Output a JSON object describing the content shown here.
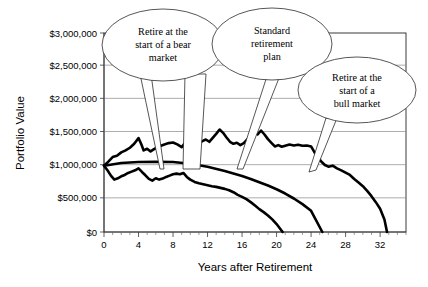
{
  "chart_data": {
    "type": "line",
    "title": "",
    "xlabel": "Years after Retirement",
    "ylabel": "Portfolio Value",
    "xlim": [
      0,
      35
    ],
    "ylim": [
      0,
      3000000
    ],
    "grid": true,
    "legend_position": "none",
    "y_ticks": [
      0,
      500000,
      1000000,
      1500000,
      2000000,
      2500000,
      3000000
    ],
    "y_tick_labels": [
      "$0",
      "$500,000",
      "$1,000,000",
      "$1,500,000",
      "$2,000,000",
      "$2,500,000",
      "$3,000,000"
    ],
    "x_ticks": [
      0,
      4,
      8,
      12,
      16,
      20,
      24,
      28,
      32
    ],
    "x_tick_labels": [
      "0",
      "4",
      "8",
      "12",
      "16",
      "20",
      "24",
      "28",
      "32"
    ],
    "x_minor_tick_step": 1,
    "series": [
      {
        "name": "Retire at the start of a bull market",
        "x": [
          0,
          0.5,
          1,
          1.5,
          2,
          2.5,
          3,
          3.5,
          4,
          4.3,
          4.6,
          5,
          5.4,
          5.8,
          6.2,
          6.6,
          7,
          7.5,
          8,
          8.5,
          9,
          9.4,
          9.8,
          10.2,
          10.6,
          11,
          11.4,
          11.8,
          12.2,
          12.6,
          13,
          13.4,
          13.8,
          14.2,
          14.6,
          15,
          15.4,
          15.8,
          16.2,
          16.6,
          17,
          17.4,
          17.8,
          18.2,
          18.6,
          19,
          19.4,
          19.8,
          20.2,
          20.6,
          21,
          21.5,
          22,
          22.5,
          23,
          23.5,
          24,
          24.4,
          24.8,
          25.2,
          25.6,
          26,
          26.5,
          27,
          27.5,
          28,
          28.5,
          29,
          29.5,
          30,
          30.5,
          31,
          31.5,
          32,
          32.5,
          32.8
        ],
        "y": [
          1000000,
          1060000,
          1130000,
          1150000,
          1200000,
          1230000,
          1270000,
          1330000,
          1415000,
          1330000,
          1230000,
          1255000,
          1215000,
          1250000,
          1280000,
          1300000,
          1320000,
          1340000,
          1350000,
          1320000,
          1280000,
          1345000,
          1470000,
          1440000,
          1390000,
          1340000,
          1370000,
          1395000,
          1360000,
          1420000,
          1480000,
          1545000,
          1495000,
          1425000,
          1360000,
          1330000,
          1345000,
          1310000,
          1340000,
          1395000,
          1460000,
          1505000,
          1470000,
          1530000,
          1470000,
          1400000,
          1345000,
          1290000,
          1310000,
          1285000,
          1300000,
          1320000,
          1305000,
          1315000,
          1300000,
          1305000,
          1290000,
          1200000,
          1130000,
          1060000,
          1010000,
          985000,
          1000000,
          960000,
          930000,
          895000,
          860000,
          800000,
          745000,
          690000,
          620000,
          540000,
          450000,
          350000,
          190000,
          0
        ],
        "style": "volatile-upper",
        "callout": "Retire at the start of a bull market"
      },
      {
        "name": "Standard retirement plan",
        "x": [
          0,
          2,
          4,
          6,
          8,
          10,
          12,
          14,
          16,
          17,
          18,
          19,
          20,
          21,
          22,
          23,
          24,
          25.3
        ],
        "y": [
          1000000,
          1040000,
          1055000,
          1060000,
          1055000,
          1030000,
          985000,
          920000,
          845000,
          800000,
          750000,
          700000,
          645000,
          580000,
          505000,
          420000,
          320000,
          0
        ],
        "style": "smooth-middle",
        "callout": "Standard retirement plan"
      },
      {
        "name": "Retire at the start of a bear market",
        "x": [
          0,
          0.4,
          0.8,
          1.2,
          1.6,
          2,
          2.4,
          2.8,
          3.2,
          3.6,
          4,
          4.4,
          4.8,
          5.2,
          5.6,
          6,
          6.4,
          6.8,
          7.2,
          7.6,
          8,
          8.4,
          8.8,
          9.2,
          9.6,
          10,
          10.5,
          11,
          11.5,
          12,
          12.5,
          13,
          13.5,
          14,
          14.5,
          15,
          15.5,
          16,
          16.5,
          17,
          17.5,
          18,
          18.5,
          19,
          19.5,
          20,
          20.7
        ],
        "y": [
          1000000,
          930000,
          850000,
          790000,
          810000,
          840000,
          860000,
          890000,
          910000,
          930000,
          960000,
          905000,
          855000,
          800000,
          775000,
          810000,
          790000,
          805000,
          830000,
          850000,
          870000,
          880000,
          870000,
          890000,
          830000,
          790000,
          755000,
          735000,
          720000,
          705000,
          690000,
          680000,
          665000,
          650000,
          630000,
          600000,
          560000,
          530000,
          495000,
          450000,
          400000,
          345000,
          300000,
          250000,
          190000,
          120000,
          0
        ],
        "style": "volatile-lower",
        "callout": "Retire at the start of a bear market"
      }
    ],
    "annotations": [
      {
        "id": "bear-callout",
        "lines": [
          "Retire at the",
          "start of a bear",
          "market"
        ],
        "points_to_series": "Retire at the start of a bear market"
      },
      {
        "id": "standard-callout",
        "lines": [
          "Standard",
          "retirement",
          "plan"
        ],
        "points_to_series": "Standard retirement plan"
      },
      {
        "id": "bull-callout",
        "lines": [
          "Retire at the",
          "start of a",
          "bull market"
        ],
        "points_to_series": "Retire at the start of a bull market"
      }
    ],
    "colors": {
      "series_line": "#000000",
      "gridline": "#8a8a8a",
      "frame": "#3a3a3a",
      "background": "#ffffff",
      "text": "#000000"
    }
  }
}
